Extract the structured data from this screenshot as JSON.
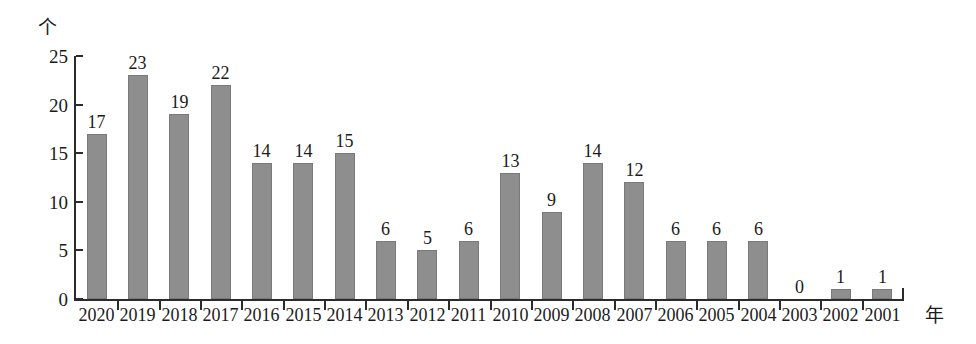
{
  "chart_data": {
    "type": "bar",
    "title": "",
    "subtitle": "",
    "xlabel": "年",
    "ylabel": "个",
    "categories": [
      "2020",
      "2019",
      "2018",
      "2017",
      "2016",
      "2015",
      "2014",
      "2013",
      "2012",
      "2011",
      "2010",
      "2009",
      "2008",
      "2007",
      "2006",
      "2005",
      "2004",
      "2003",
      "2002",
      "2001"
    ],
    "values": [
      17,
      23,
      19,
      22,
      14,
      14,
      15,
      6,
      5,
      6,
      13,
      9,
      14,
      12,
      6,
      6,
      6,
      0,
      1,
      1
    ],
    "value_labels": [
      "17",
      "23",
      "19",
      "22",
      "14",
      "14",
      "15",
      "6",
      "5",
      "6",
      "13",
      "9",
      "14",
      "12",
      "6",
      "6",
      "6",
      "0",
      "1",
      "1"
    ],
    "ylim": [
      0,
      25
    ],
    "ytick_values": [
      0,
      5,
      10,
      15,
      20,
      25
    ],
    "ytick_labels": [
      "0",
      "5",
      "10",
      "15",
      "20",
      "25"
    ],
    "grid": false,
    "legend": null,
    "legend_position": "none",
    "bar_color": "#8e8e8e",
    "bar_edge_color": "#7a7a7a",
    "axis_color": "#2b2b2b",
    "text_color": "#1b1b1b",
    "background_color": "#ffffff"
  }
}
